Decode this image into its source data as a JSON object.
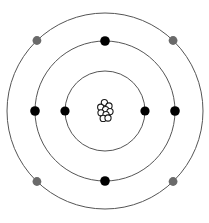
{
  "diagram": {
    "type": "bohr-atom",
    "canvas": {
      "width": 209,
      "height": 223,
      "background": "#ffffff"
    },
    "center": {
      "x": 105,
      "y": 111
    },
    "colors": {
      "shell_stroke": "#555555",
      "electron_inner": "#000000",
      "electron_outer": "#6a6a6a",
      "nucleon_stroke": "#1a1a1a",
      "nucleon_fill": "#ffffff",
      "background": "#ffffff"
    },
    "nucleus": {
      "label": "nucleus",
      "particle_radius": 3.1,
      "particle_count": 9,
      "particles": [
        {
          "dx": -0.6,
          "dy": -8.4
        },
        {
          "dx": 4.0,
          "dy": -5.0
        },
        {
          "dx": -4.3,
          "dy": -3.8
        },
        {
          "dx": 0.6,
          "dy": -1.4
        },
        {
          "dx": 5.0,
          "dy": 0.6
        },
        {
          "dx": -4.0,
          "dy": 1.8
        },
        {
          "dx": 1.0,
          "dy": 3.6
        },
        {
          "dx": -1.8,
          "dy": 7.4
        },
        {
          "dx": 3.0,
          "dy": 7.0
        }
      ]
    },
    "shells": [
      {
        "name": "shell-1",
        "label": "K shell",
        "radius": 40,
        "stroke": "#555555",
        "stroke_width": 1,
        "electron_count": 2,
        "electron_color": "#000000",
        "electron_radius": 4.6,
        "electrons": [
          {
            "name": "electron-k-left",
            "angle_deg": 180
          },
          {
            "name": "electron-k-right",
            "angle_deg": 0
          }
        ]
      },
      {
        "name": "shell-2",
        "label": "L shell",
        "radius": 70,
        "stroke": "#555555",
        "stroke_width": 1,
        "electron_count": 4,
        "electron_color": "#000000",
        "electron_radius": 4.8,
        "electrons": [
          {
            "name": "electron-l-top",
            "angle_deg": 90
          },
          {
            "name": "electron-l-left",
            "angle_deg": 180
          },
          {
            "name": "electron-l-bottom",
            "angle_deg": 270
          },
          {
            "name": "electron-l-right",
            "angle_deg": 0
          }
        ]
      },
      {
        "name": "shell-3",
        "label": "M shell",
        "radius": 98,
        "stroke": "#555555",
        "stroke_width": 1,
        "electron_count": 4,
        "electron_color": "#6a6a6a",
        "electron_radius": 4.4,
        "electrons": [
          {
            "name": "electron-m-top-left",
            "angle_deg": 134
          },
          {
            "name": "electron-m-top-right",
            "angle_deg": 46
          },
          {
            "name": "electron-m-bottom-left",
            "angle_deg": 226
          },
          {
            "name": "electron-m-bottom-right",
            "angle_deg": 314
          }
        ]
      }
    ],
    "totals": {
      "electron_total": 10,
      "shell_total": 3
    }
  }
}
